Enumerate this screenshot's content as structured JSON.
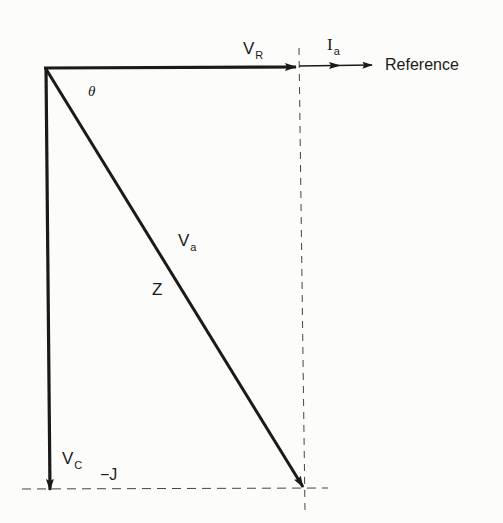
{
  "diagram": {
    "type": "phasor-diagram",
    "colors": {
      "ink": "#1a1a1a",
      "dashed": "#444444",
      "background": "#fcfcfa"
    },
    "labels": {
      "vr_main": "V",
      "vr_sub": "R",
      "ia_main": "I",
      "ia_sub": "a",
      "reference": "Reference",
      "theta": "θ",
      "va_main": "V",
      "va_sub": "a",
      "z": "Z",
      "vc_main": "V",
      "vc_sub": "C",
      "neg_j": "−J"
    },
    "vectors": [
      {
        "name": "V_R",
        "from": [
          45,
          68
        ],
        "to": [
          297,
          67
        ],
        "style": "thick-arrow"
      },
      {
        "name": "I_a",
        "from": [
          299,
          66
        ],
        "to": [
          372,
          65
        ],
        "style": "thin-arrow-with-midarrow"
      },
      {
        "name": "V_a",
        "from": [
          45,
          68
        ],
        "to": [
          304,
          488
        ],
        "style": "thick-arrow"
      },
      {
        "name": "V_C",
        "from": [
          46,
          68
        ],
        "to": [
          50,
          490
        ],
        "style": "thick-arrow"
      }
    ],
    "guides": [
      {
        "name": "vertical-dashed",
        "from": [
          299,
          48
        ],
        "to": [
          305,
          512
        ]
      },
      {
        "name": "horizontal-dashed",
        "from": [
          22,
          489
        ],
        "to": [
          328,
          488
        ]
      }
    ]
  }
}
